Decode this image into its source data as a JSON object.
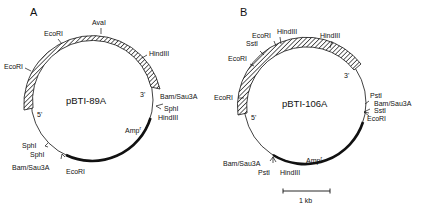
{
  "figure": {
    "panels": [
      {
        "letter": "A",
        "plasmid": "pBTI-89A",
        "ends": {
          "five_prime": "5'",
          "three_prime": "3'"
        },
        "insert_label_sites": [
          "EcoRI",
          "EcoRI",
          "AvaI",
          "HindIII"
        ],
        "vector_sites": [
          "Bam/Sau3A",
          "SphI",
          "HindIII",
          "EcoRI",
          "Bam/Sau3A",
          "SphI",
          "SphI"
        ],
        "resistance": "Amp",
        "resistance_sup": "r",
        "labels": {
          "ecori_1": "EcoRI",
          "ecori_2": "EcoRI",
          "ava": "AvaI",
          "hind": "HindIII",
          "bam": "Bam/Sau3A",
          "sph": "SphI",
          "hind2": "HindIII",
          "ecori_3": "EcoRI",
          "bam2": "Bam/Sau3A",
          "sph2": "SphI",
          "sph3": "SphI"
        }
      },
      {
        "letter": "B",
        "plasmid": "pBTI-106A",
        "ends": {
          "five_prime": "5'",
          "three_prime": "3'"
        },
        "resistance": "Amp",
        "resistance_sup": "r",
        "labels": {
          "ecori_1": "EcoRI",
          "hind_1": "HindIII",
          "hind_2": "HindIII",
          "sst_1": "SstI",
          "ecori_2": "EcoRI",
          "ecori_3": "EcoRI",
          "pst_1": "PstI",
          "bam_1": "Bam/Sau3A",
          "sst_2": "SstI",
          "ecori_4": "EcoRI",
          "bam_2": "Bam/Sau3A",
          "pst_2": "PstI",
          "hind_3": "HindIII"
        }
      }
    ],
    "scale_bar": {
      "label": "1 kb"
    }
  }
}
